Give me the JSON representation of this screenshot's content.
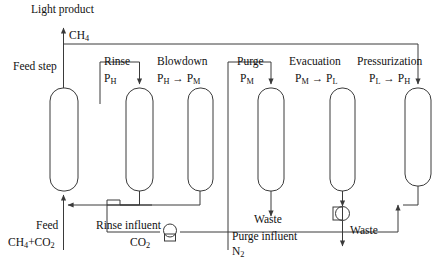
{
  "diagram": {
    "title_text": "PSA cycle step schematic",
    "line_color": "#3a3a3a",
    "text_color": "#111111",
    "background": "#ffffff",
    "columns": [
      {
        "id": "col-feed",
        "step": "Feed step",
        "pressure": "",
        "x": 50,
        "y": 88,
        "w": 28,
        "h": 103
      },
      {
        "id": "col-rinse",
        "step": "Rinse",
        "pressure": "P_H",
        "x": 126,
        "y": 88,
        "w": 27,
        "h": 103
      },
      {
        "id": "col-blowdown",
        "step": "Blowdown",
        "pressure": "P_H -> P_M",
        "x": 188,
        "y": 88,
        "w": 25,
        "h": 103
      },
      {
        "id": "col-purge",
        "step": "Purge",
        "pressure": "P_M",
        "x": 258,
        "y": 88,
        "w": 26,
        "h": 103
      },
      {
        "id": "col-evacuation",
        "step": "Evacuation",
        "pressure": "P_M -> P_L",
        "x": 330,
        "y": 88,
        "w": 25,
        "h": 103
      },
      {
        "id": "col-pressurization",
        "step": "Pressurization",
        "pressure": "P_L -> P_H",
        "x": 405,
        "y": 88,
        "w": 26,
        "h": 98
      }
    ],
    "labels": {
      "light_product": "Light product",
      "ch4": "CH",
      "ch4_sub": "4",
      "feed_step": "Feed step",
      "rinse": "Rinse",
      "rinse_p": "P",
      "rinse_p_sub": "H",
      "blowdown": "Blowdown",
      "blowdown_p1": "P",
      "blowdown_p1_sub": "H",
      "blowdown_arrow": " → ",
      "blowdown_p2": "P",
      "blowdown_p2_sub": "M",
      "purge": "Purge",
      "purge_p": "P",
      "purge_p_sub": "M",
      "evacuation": "Evacuation",
      "evac_p1": "P",
      "evac_p1_sub": "M",
      "evac_arrow": " → ",
      "evac_p2": "P",
      "evac_p2_sub": "L",
      "pressurization": "Pressurization",
      "press_p1": "P",
      "press_p1_sub": "L",
      "press_arrow": " → ",
      "press_p2": "P",
      "press_p2_sub": "H",
      "feed": "Feed",
      "feed_species_1": "CH",
      "feed_species_1_sub": "4",
      "feed_plus": "+CO",
      "feed_species_2_sub": "2",
      "rinse_influent": "Rinse influent",
      "rinse_influent_species": "CO",
      "rinse_influent_species_sub": "2",
      "purge_influent": "Purge influent",
      "purge_influent_species": "N",
      "purge_influent_species_sub": "2",
      "waste_purge": "Waste",
      "waste_evacuation": "Waste"
    },
    "equipment": {
      "rinse_pump": "compressor-pump",
      "evacuation_pump": "vacuum-pump"
    }
  }
}
